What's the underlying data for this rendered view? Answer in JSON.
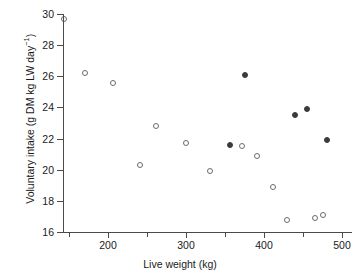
{
  "chart_data": {
    "type": "scatter",
    "title": "",
    "xlabel": "Live weight (kg)",
    "ylabel": "Voluntary intake (g DM kg LW day",
    "ylabel_exponent": "−1",
    "ylabel_suffix": ")",
    "xlim": [
      130,
      500
    ],
    "ylim": [
      16,
      30
    ],
    "xticks": [
      200,
      300,
      400,
      500
    ],
    "xticks_minor": [
      150,
      250,
      350,
      450
    ],
    "yticks": [
      16,
      18,
      20,
      22,
      24,
      26,
      28,
      30
    ],
    "xtick_labels": [
      "200",
      "300",
      "400",
      "500"
    ],
    "ytick_labels": [
      "16",
      "18",
      "20",
      "22",
      "24",
      "26",
      "28",
      "30"
    ],
    "grid": false,
    "legend": "none",
    "marker_open_color": "#6b6b6b",
    "marker_filled_color": "#3a3a42",
    "series": [
      {
        "name": "open",
        "marker": "open-circle",
        "points": [
          {
            "x": 144,
            "y": 29.7
          },
          {
            "x": 171,
            "y": 26.2
          },
          {
            "x": 206,
            "y": 25.6
          },
          {
            "x": 262,
            "y": 22.8
          },
          {
            "x": 241,
            "y": 20.3
          },
          {
            "x": 300,
            "y": 21.7
          },
          {
            "x": 331,
            "y": 19.9
          },
          {
            "x": 372,
            "y": 21.5
          },
          {
            "x": 391,
            "y": 20.9
          },
          {
            "x": 412,
            "y": 18.9
          },
          {
            "x": 430,
            "y": 16.8
          },
          {
            "x": 466,
            "y": 16.9
          },
          {
            "x": 476,
            "y": 17.1
          }
        ]
      },
      {
        "name": "filled",
        "marker": "filled-circle",
        "points": [
          {
            "x": 375,
            "y": 26.1
          },
          {
            "x": 356,
            "y": 21.6
          },
          {
            "x": 440,
            "y": 23.5
          },
          {
            "x": 455,
            "y": 23.9
          },
          {
            "x": 481,
            "y": 21.9
          }
        ]
      }
    ]
  }
}
